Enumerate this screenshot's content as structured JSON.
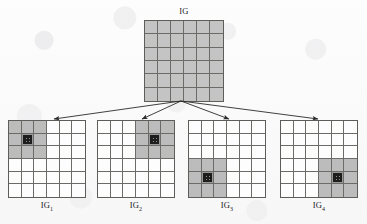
{
  "diagram": {
    "title": "IG",
    "type": "image-grid-quadtree-decomposition",
    "background_color": "#fbfbfb",
    "grid_line_color": "#6b6b68",
    "shade_color": "#bcbcbc",
    "hatch_color": "#1d1d1d"
  },
  "parent": {
    "label": "IG",
    "label_base": "IG",
    "label_sub": "",
    "rows": 6,
    "cols": 6,
    "shaded_cells": "all",
    "hatched_cell": null
  },
  "children": [
    {
      "label": "IG1",
      "label_base": "IG",
      "label_sub": "1",
      "rows": 6,
      "cols": 6,
      "shaded_quadrant": "top-left",
      "shaded_rows": [
        1,
        2,
        3
      ],
      "shaded_cols": [
        1,
        2,
        3
      ],
      "hatched_cell": {
        "row": 2,
        "col": 2
      }
    },
    {
      "label": "IG2",
      "label_base": "IG",
      "label_sub": "2",
      "rows": 6,
      "cols": 6,
      "shaded_quadrant": "top-right",
      "shaded_rows": [
        1,
        2,
        3
      ],
      "shaded_cols": [
        4,
        5,
        6
      ],
      "hatched_cell": {
        "row": 2,
        "col": 5
      }
    },
    {
      "label": "IG3",
      "label_base": "IG",
      "label_sub": "3",
      "rows": 6,
      "cols": 6,
      "shaded_quadrant": "bottom-left",
      "shaded_rows": [
        4,
        5,
        6
      ],
      "shaded_cols": [
        1,
        2,
        3
      ],
      "hatched_cell": {
        "row": 5,
        "col": 2
      }
    },
    {
      "label": "IG4",
      "label_base": "IG",
      "label_sub": "4",
      "rows": 6,
      "cols": 6,
      "shaded_quadrant": "bottom-right",
      "shaded_rows": [
        4,
        5,
        6
      ],
      "shaded_cols": [
        4,
        5,
        6
      ],
      "hatched_cell": {
        "row": 5,
        "col": 5
      }
    }
  ],
  "arrows": {
    "count": 4,
    "origin": {
      "x": 181,
      "y": 101
    },
    "targets": [
      {
        "x": 54,
        "y": 119
      },
      {
        "x": 142,
        "y": 119
      },
      {
        "x": 229,
        "y": 119
      },
      {
        "x": 318,
        "y": 119
      }
    ],
    "color": "#2a2a28"
  }
}
